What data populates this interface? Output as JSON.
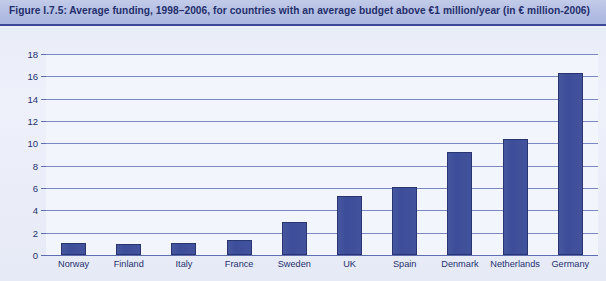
{
  "figure": {
    "title": "Figure I.7.5: Average funding, 1998–2006, for countries with an average budget above €1 million/year (in € million-2006)"
  },
  "colors": {
    "banner_start": "#c2cbe8",
    "banner_end": "#aab6df",
    "title_text": "#242f6b",
    "bar_fill": "#3f4f9d",
    "bar_border": "#2a3470",
    "gridline": "#7b87c0",
    "plot_background": "#f2f5fc",
    "figure_background": "#eaeef8"
  },
  "chart_data": {
    "type": "bar",
    "title": "Figure I.7.5: Average funding, 1998–2006, for countries with an average budget above €1 million/year (in € million-2006)",
    "xlabel": "",
    "ylabel": "",
    "ylim": [
      0,
      18
    ],
    "ytick_step": 2,
    "yticks": [
      18,
      16,
      14,
      12,
      10,
      8,
      6,
      4,
      2,
      0
    ],
    "grid": true,
    "legend": false,
    "categories": [
      "Norway",
      "Finland",
      "Italy",
      "France",
      "Sweden",
      "UK",
      "Spain",
      "Denmark",
      "Netherlands",
      "Germany"
    ],
    "values": [
      1.1,
      1.0,
      1.1,
      1.3,
      3.0,
      5.3,
      6.1,
      9.2,
      10.4,
      16.3
    ]
  }
}
